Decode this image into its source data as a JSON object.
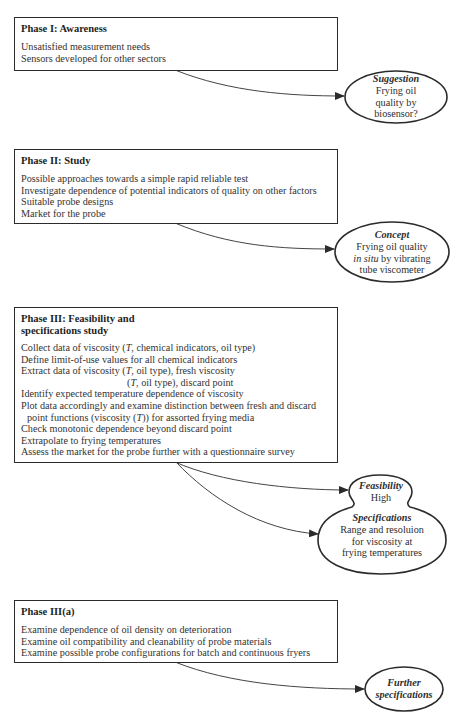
{
  "phases": [
    {
      "title": "Phase I: Awareness",
      "items": [
        "Unsatisfied measurement needs",
        "Sensors developed for other sectors"
      ]
    },
    {
      "title": "Phase II: Study",
      "items": [
        "Possible approaches towards a simple rapid reliable test",
        "Investigate dependence of potential indicators of quality on other factors",
        "Suitable probe designs",
        "Market for the probe"
      ]
    },
    {
      "title_line1": "Phase III: Feasibility and",
      "title_line2": "specifications study",
      "items": [
        {
          "pre": "Collect data of viscosity (",
          "var": "T",
          "post": ", chemical indicators, oil type)"
        },
        {
          "text": "Define limit-of-use values for all chemical indicators"
        },
        {
          "pre": "Extract data of viscosity (",
          "var": "T",
          "post": ", oil type), fresh viscosity"
        },
        {
          "pre": "(",
          "var": "T",
          "post": ", oil type), discard point"
        },
        {
          "text": "Identify expected temperature dependence of viscosity"
        },
        {
          "text": "Plot data accordingly and examine distinction between fresh and discard"
        },
        {
          "pre": "point functions (viscosity (",
          "var": "T",
          "post": ")) for assorted frying media"
        },
        {
          "text": "Check monotonic dependence beyond discard point"
        },
        {
          "text": "Extrapolate to frying temperatures"
        },
        {
          "text": "Assess the market for the probe further with a questionnaire survey"
        }
      ]
    },
    {
      "title": "Phase III(a)",
      "items": [
        "Examine dependence of oil density on deterioration",
        "Examine oil compatibility and cleanability of probe materials",
        "Examine possible probe configurations for batch and continuous fryers"
      ]
    }
  ],
  "outcomes": {
    "suggestion": {
      "head": "Suggestion",
      "lines": [
        "Frying oil",
        "quality by",
        "biosensor?"
      ]
    },
    "concept": {
      "head": "Concept",
      "line1": "Frying oil quality",
      "line2_italic": "in situ",
      "line2_rest": " by vibrating",
      "line3": "tube viscometer"
    },
    "feasibility": {
      "head": "Feasibility",
      "value": "High"
    },
    "specifications": {
      "head": "Specifications",
      "lines": [
        "Range and resoluion",
        "for viscosity at",
        "frying temperatures"
      ]
    },
    "further": {
      "head_line1": "Further",
      "head_line2": "specifications"
    }
  },
  "colors": {
    "stroke": "#2b2b2b",
    "text": "#2e2e2e",
    "background": "#ffffff"
  }
}
